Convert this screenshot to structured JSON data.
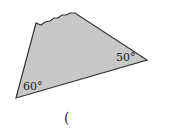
{
  "figure": {
    "shape": "quadrilateral with torn top edge",
    "fill_color": "#c8c8c8",
    "stroke_color": "#333333",
    "angles": [
      {
        "id": "bottom-left",
        "label": "60°"
      },
      {
        "id": "right",
        "label": "50°"
      }
    ]
  },
  "answer_blank": {
    "text": "("
  }
}
